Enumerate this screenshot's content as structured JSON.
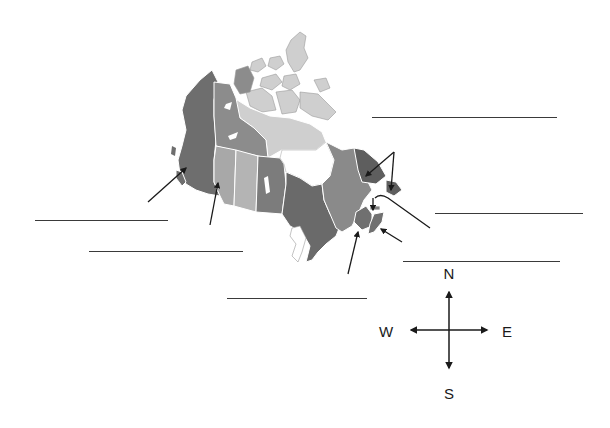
{
  "worksheet": {
    "title": "Provinces and Territories of Canada",
    "colors": {
      "background": "#ffffff",
      "outline": "#ffffff",
      "line": "#3a3a3a",
      "arrow": "#1a1a1a",
      "region_shades": {
        "bc_yukon": "#6e6e6e",
        "nwt": "#8c8c8c",
        "nunavut": "#cfcfcf",
        "alberta": "#a8a8a8",
        "saskatchewan": "#b4b4b4",
        "manitoba": "#7c7c7c",
        "ontario": "#6a6a6a",
        "quebec": "#8a8a8a",
        "labrador": "#5e5e5e",
        "maritimes": "#707070",
        "hudson_bay": "#ffffff"
      }
    },
    "blank_lines": [
      {
        "id": "line-1",
        "x1": 372,
        "x2": 557,
        "y": 118
      },
      {
        "id": "line-2",
        "x1": 35,
        "x2": 168,
        "y": 221
      },
      {
        "id": "line-3",
        "x1": 89,
        "x2": 243,
        "y": 252
      },
      {
        "id": "line-4",
        "x1": 435,
        "x2": 583,
        "y": 214
      },
      {
        "id": "line-5",
        "x1": 403,
        "x2": 560,
        "y": 262
      },
      {
        "id": "line-6",
        "x1": 227,
        "x2": 367,
        "y": 299
      }
    ],
    "compass": {
      "north": "N",
      "south": "S",
      "east": "E",
      "west": "W"
    }
  }
}
